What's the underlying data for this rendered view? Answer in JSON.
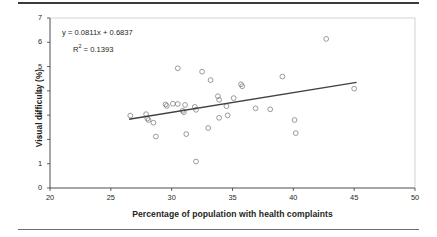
{
  "figure": {
    "rule_top": "horizontal-rule",
    "rule_bottom": "horizontal-rule"
  },
  "chart_data": {
    "type": "scatter",
    "title": "",
    "xlabel": "Percentage of population with health complaints",
    "ylabel": "Visual difficulty (%)",
    "xlim": [
      20,
      50
    ],
    "ylim": [
      0,
      7
    ],
    "xticks": [
      20,
      25,
      30,
      35,
      40,
      45,
      50
    ],
    "yticks": [
      0,
      1,
      2,
      3,
      4,
      5,
      6,
      7
    ],
    "grid": false,
    "legend": null,
    "annotations": {
      "equation": "y = 0.0811x + 0.6837",
      "r_squared_prefix": "R",
      "r_squared_exponent": "2",
      "r_squared_value": " = 0.1393"
    },
    "trendline": {
      "slope": 0.0811,
      "intercept": 0.6837,
      "r_squared": 0.1393,
      "x_start": 26.5,
      "x_end": 45.2
    },
    "marker_style": "open-circle",
    "points": [
      {
        "x": 26.6,
        "y": 2.98
      },
      {
        "x": 27.9,
        "y": 3.04
      },
      {
        "x": 28.0,
        "y": 2.86
      },
      {
        "x": 28.1,
        "y": 2.8
      },
      {
        "x": 28.5,
        "y": 2.69
      },
      {
        "x": 28.7,
        "y": 2.12
      },
      {
        "x": 29.5,
        "y": 3.44
      },
      {
        "x": 29.6,
        "y": 3.38
      },
      {
        "x": 30.1,
        "y": 3.47
      },
      {
        "x": 30.5,
        "y": 3.46
      },
      {
        "x": 30.5,
        "y": 4.93
      },
      {
        "x": 30.9,
        "y": 3.18
      },
      {
        "x": 31.0,
        "y": 3.12
      },
      {
        "x": 31.1,
        "y": 3.42
      },
      {
        "x": 31.2,
        "y": 2.22
      },
      {
        "x": 31.9,
        "y": 3.34
      },
      {
        "x": 32.0,
        "y": 3.22
      },
      {
        "x": 32.0,
        "y": 1.09
      },
      {
        "x": 32.5,
        "y": 4.79
      },
      {
        "x": 33.0,
        "y": 2.47
      },
      {
        "x": 33.2,
        "y": 4.44
      },
      {
        "x": 33.8,
        "y": 3.78
      },
      {
        "x": 33.9,
        "y": 3.63
      },
      {
        "x": 33.9,
        "y": 2.89
      },
      {
        "x": 34.5,
        "y": 3.37
      },
      {
        "x": 34.6,
        "y": 2.99
      },
      {
        "x": 35.1,
        "y": 3.7
      },
      {
        "x": 35.7,
        "y": 4.27
      },
      {
        "x": 35.8,
        "y": 4.19
      },
      {
        "x": 36.9,
        "y": 3.28
      },
      {
        "x": 38.1,
        "y": 3.24
      },
      {
        "x": 39.1,
        "y": 4.59
      },
      {
        "x": 40.1,
        "y": 2.8
      },
      {
        "x": 40.2,
        "y": 2.26
      },
      {
        "x": 42.7,
        "y": 6.14
      },
      {
        "x": 45.0,
        "y": 4.09
      }
    ]
  }
}
